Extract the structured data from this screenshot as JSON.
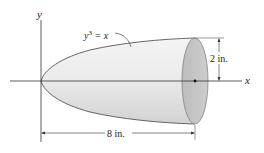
{
  "figure": {
    "type": "solid-of-revolution",
    "colors": {
      "background": "#ffffff",
      "body_light": "#f2f2f2",
      "body_mid": "#d9d9d9",
      "end_face": "#c4c4c4",
      "outline": "#555555",
      "axis": "#333333"
    }
  },
  "axes": {
    "x_label": "x",
    "y_label": "y"
  },
  "curve": {
    "equation_base": "y",
    "equation_exp": "3",
    "equation_rest": " = x"
  },
  "dimensions": {
    "radius": "2 in.",
    "length": "8 in."
  }
}
